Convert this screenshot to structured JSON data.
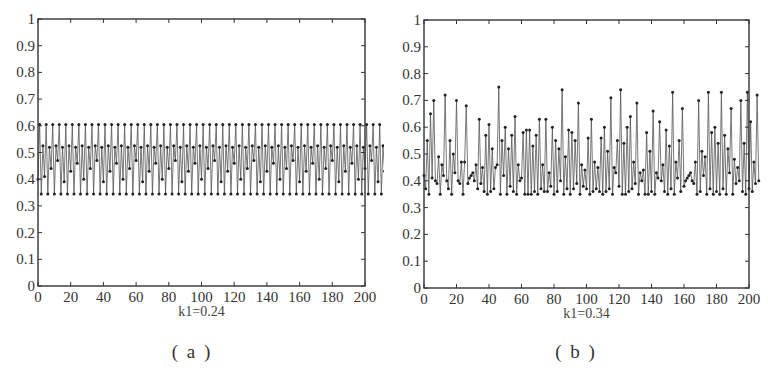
{
  "chart_data": [
    {
      "id": "a",
      "type": "line",
      "marker": "dot",
      "caption": "( a )",
      "xlabel": "k1=0.24",
      "ylabel": "",
      "title": "",
      "xlim": [
        0,
        200
      ],
      "ylim": [
        0,
        1
      ],
      "xticks": [
        0,
        20,
        40,
        60,
        80,
        100,
        120,
        140,
        160,
        180,
        200
      ],
      "yticks": [
        0,
        0.1,
        0.2,
        0.3,
        0.4,
        0.5,
        0.6,
        0.7,
        0.8,
        0.9,
        1
      ],
      "ytick_labels": [
        "0",
        "0.1",
        "0.2",
        "0.3",
        "0.4",
        "0.5",
        "0.6",
        "0.7",
        "0.8",
        "0.9",
        "1"
      ],
      "grid": false,
      "frame": {
        "left": 38,
        "top": 19,
        "right": 365,
        "bottom": 286
      },
      "description": "Periodic oscillation: values cycle between ~0.345 and ~0.605 with intermediate levels ~0.40-0.53",
      "x": "0..200 step 1",
      "values": [
        0.4,
        0.605,
        0.345,
        0.525,
        0.41,
        0.605,
        0.345,
        0.52,
        0.44,
        0.605,
        0.345,
        0.525,
        0.47,
        0.605,
        0.345,
        0.52,
        0.39,
        0.605,
        0.345,
        0.525,
        0.43,
        0.605,
        0.345,
        0.52,
        0.46,
        0.605,
        0.345,
        0.525,
        0.4,
        0.605,
        0.345,
        0.52,
        0.44,
        0.605,
        0.345,
        0.525,
        0.47,
        0.605,
        0.345,
        0.52,
        0.39,
        0.605,
        0.345,
        0.525,
        0.43,
        0.605,
        0.345,
        0.52,
        0.46,
        0.605,
        0.345,
        0.525,
        0.4,
        0.605,
        0.345,
        0.52,
        0.44,
        0.605,
        0.345,
        0.525,
        0.47,
        0.605,
        0.345,
        0.52,
        0.39,
        0.605,
        0.345,
        0.525,
        0.43,
        0.605,
        0.345,
        0.52,
        0.46,
        0.605,
        0.345,
        0.525,
        0.4,
        0.605,
        0.345,
        0.52,
        0.44,
        0.605,
        0.345,
        0.525,
        0.47,
        0.605,
        0.345,
        0.52,
        0.39,
        0.605,
        0.345,
        0.525,
        0.43,
        0.605,
        0.345,
        0.52,
        0.46,
        0.605,
        0.345,
        0.525,
        0.4,
        0.605,
        0.345,
        0.52,
        0.44,
        0.605,
        0.345,
        0.525,
        0.47,
        0.605,
        0.345,
        0.52,
        0.39,
        0.605,
        0.345,
        0.525,
        0.43,
        0.605,
        0.345,
        0.52,
        0.46,
        0.605,
        0.345,
        0.525,
        0.4,
        0.605,
        0.345,
        0.52,
        0.44,
        0.605,
        0.345,
        0.525,
        0.47,
        0.605,
        0.345,
        0.52,
        0.39,
        0.605,
        0.345,
        0.525,
        0.43,
        0.605,
        0.345,
        0.52,
        0.46,
        0.605,
        0.345,
        0.525,
        0.4,
        0.605,
        0.345,
        0.52,
        0.44,
        0.605,
        0.345,
        0.525,
        0.47,
        0.605,
        0.345,
        0.52,
        0.39,
        0.605,
        0.345,
        0.525,
        0.43,
        0.605,
        0.345,
        0.52,
        0.46,
        0.605,
        0.345,
        0.525,
        0.4,
        0.605,
        0.345,
        0.52,
        0.44,
        0.605,
        0.345,
        0.525,
        0.47,
        0.605,
        0.345,
        0.52,
        0.39,
        0.605,
        0.345,
        0.525,
        0.43,
        0.605,
        0.345,
        0.52,
        0.46,
        0.605,
        0.345,
        0.525,
        0.4,
        0.605,
        0.345,
        0.52,
        0.44,
        0.605,
        0.345,
        0.525,
        0.47,
        0.605,
        0.345,
        0.52,
        0.39,
        0.605,
        0.345,
        0.525,
        0.43,
        0.605,
        0.345,
        0.52,
        0.46,
        0.6,
        0.345,
        0.52,
        0.45
      ]
    },
    {
      "id": "b",
      "type": "line",
      "marker": "dot",
      "caption": "( b )",
      "xlabel": "k1=0.34",
      "ylabel": "",
      "title": "",
      "xlim": [
        0,
        200
      ],
      "ylim": [
        0,
        1
      ],
      "xticks": [
        0,
        20,
        40,
        60,
        80,
        100,
        120,
        140,
        160,
        180,
        200
      ],
      "yticks": [
        0,
        0.1,
        0.2,
        0.3,
        0.4,
        0.5,
        0.6,
        0.7,
        0.8,
        0.9,
        1
      ],
      "ytick_labels": [
        "0",
        "0.1",
        "0.2",
        "0.3",
        "0.4",
        "0.5",
        "0.6",
        "0.7",
        "0.8",
        "0.9",
        "1"
      ],
      "grid": false,
      "frame": {
        "left": 424,
        "top": 20,
        "right": 749,
        "bottom": 288
      },
      "description": "Chaotic oscillation: values irregular between ~0.34 and ~0.75",
      "x": "0..200 step 1",
      "values": [
        0.42,
        0.37,
        0.55,
        0.35,
        0.65,
        0.41,
        0.7,
        0.4,
        0.39,
        0.49,
        0.35,
        0.46,
        0.42,
        0.72,
        0.4,
        0.37,
        0.55,
        0.35,
        0.5,
        0.43,
        0.7,
        0.4,
        0.39,
        0.47,
        0.35,
        0.47,
        0.68,
        0.39,
        0.41,
        0.42,
        0.43,
        0.4,
        0.46,
        0.37,
        0.63,
        0.39,
        0.45,
        0.36,
        0.57,
        0.35,
        0.61,
        0.36,
        0.52,
        0.37,
        0.45,
        0.46,
        0.75,
        0.35,
        0.55,
        0.42,
        0.6,
        0.35,
        0.52,
        0.38,
        0.57,
        0.36,
        0.64,
        0.35,
        0.46,
        0.4,
        0.41,
        0.58,
        0.35,
        0.59,
        0.35,
        0.59,
        0.35,
        0.53,
        0.36,
        0.57,
        0.35,
        0.63,
        0.37,
        0.46,
        0.36,
        0.63,
        0.36,
        0.43,
        0.38,
        0.6,
        0.35,
        0.55,
        0.36,
        0.52,
        0.4,
        0.74,
        0.35,
        0.49,
        0.37,
        0.59,
        0.35,
        0.58,
        0.37,
        0.55,
        0.39,
        0.69,
        0.35,
        0.46,
        0.38,
        0.44,
        0.37,
        0.56,
        0.35,
        0.63,
        0.36,
        0.47,
        0.37,
        0.45,
        0.36,
        0.56,
        0.35,
        0.6,
        0.36,
        0.51,
        0.37,
        0.71,
        0.35,
        0.45,
        0.43,
        0.55,
        0.38,
        0.74,
        0.35,
        0.54,
        0.35,
        0.6,
        0.36,
        0.64,
        0.37,
        0.47,
        0.39,
        0.69,
        0.35,
        0.43,
        0.4,
        0.44,
        0.35,
        0.58,
        0.35,
        0.51,
        0.36,
        0.66,
        0.35,
        0.43,
        0.41,
        0.62,
        0.4,
        0.46,
        0.36,
        0.59,
        0.35,
        0.53,
        0.37,
        0.73,
        0.35,
        0.47,
        0.41,
        0.55,
        0.36,
        0.67,
        0.38,
        0.4,
        0.41,
        0.42,
        0.43,
        0.4,
        0.39,
        0.47,
        0.35,
        0.7,
        0.36,
        0.51,
        0.42,
        0.49,
        0.35,
        0.73,
        0.37,
        0.58,
        0.35,
        0.6,
        0.36,
        0.54,
        0.35,
        0.73,
        0.37,
        0.57,
        0.35,
        0.52,
        0.43,
        0.67,
        0.35,
        0.48,
        0.39,
        0.45,
        0.4,
        0.7,
        0.36,
        0.54,
        0.35,
        0.73,
        0.37,
        0.62,
        0.36,
        0.47,
        0.39,
        0.72,
        0.4
      ]
    }
  ]
}
